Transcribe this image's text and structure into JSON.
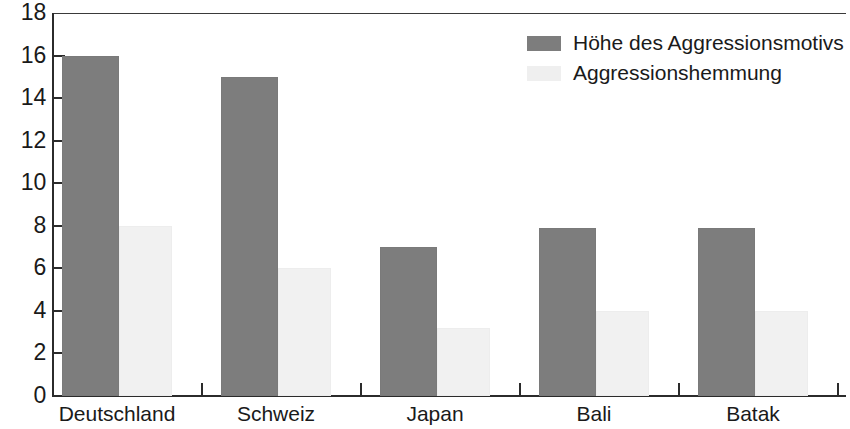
{
  "chart_data": {
    "type": "bar",
    "title": "",
    "xlabel": "",
    "ylabel": "",
    "ylim": [
      0,
      18
    ],
    "yticks": [
      0,
      2,
      4,
      6,
      8,
      10,
      12,
      14,
      16,
      18
    ],
    "grid": false,
    "legend_position": "top-right",
    "categories": [
      "Deutschland",
      "Schweiz",
      "Japan",
      "Bali",
      "Batak"
    ],
    "series": [
      {
        "name": "Höhe des Aggressionsmotivs",
        "color": "#7d7d7d",
        "values": [
          16.0,
          15.0,
          7.0,
          7.9,
          7.9
        ]
      },
      {
        "name": "Aggressionshemmung",
        "color": "#f1f1f1",
        "values": [
          8.0,
          6.0,
          3.2,
          4.0,
          4.0
        ]
      }
    ]
  },
  "axis": {
    "y_tick_labels": [
      "18",
      "16",
      "14",
      "12",
      "10",
      "8",
      "6",
      "4",
      "2",
      "0"
    ],
    "x_tick_labels": [
      "Deutschland",
      "Schweiz",
      "Japan",
      "Bali",
      "Batak"
    ]
  },
  "legend": {
    "items": [
      {
        "label": "Höhe des Aggressionsmotivs",
        "swatch": "dark"
      },
      {
        "label": "Aggressionshemmung",
        "swatch": "light"
      }
    ]
  },
  "colors": {
    "series_dark": "#7d7d7d",
    "series_light": "#f1f1f1",
    "axis": "#2b2b2b",
    "background": "#ffffff",
    "text": "#1a1a1a"
  }
}
